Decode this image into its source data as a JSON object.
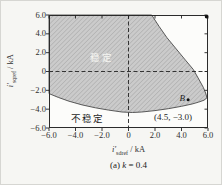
{
  "figure": {
    "caption": {
      "prefix": "(a) ",
      "var": "k",
      "rest": " = 0.4"
    }
  },
  "chart_data": {
    "type": "area",
    "xlabel": {
      "var": "i′",
      "sub": "sdref",
      "unit": " / kA"
    },
    "ylabel": {
      "var": "i′",
      "sub": "sqref",
      "unit": " / kA"
    },
    "xlim": [
      -6,
      6
    ],
    "ylim": [
      -6,
      6
    ],
    "grid": false,
    "x_tick_values": [
      -6,
      -4,
      -2,
      0,
      2,
      4,
      6
    ],
    "x_tick_labels": [
      "−6.0",
      "−4.0",
      "−2.0",
      "0",
      "2.0",
      "4.0",
      "6.0"
    ],
    "y_tick_values": [
      6,
      4,
      2,
      0,
      -2,
      -4,
      -6
    ],
    "y_tick_labels": [
      "6.0",
      "4.0",
      "2.0",
      "0",
      "−2.0",
      "−4.0",
      "−6.0"
    ],
    "reference_lines": {
      "horizontal_y": 0,
      "vertical_x": 0
    },
    "frame_color": "#2b2b2b",
    "plot_bg": "#fcfcfa",
    "stable_region": {
      "label": "稳定",
      "fill": "#cbcbcb",
      "hatch_color": "#a8a8a8",
      "edge_color": "#4a4a4a",
      "boundary": [
        [
          -6,
          6
        ],
        [
          1.75,
          6
        ],
        [
          2.3,
          4.8
        ],
        [
          2.9,
          3.6
        ],
        [
          3.6,
          2.4
        ],
        [
          4.3,
          1.2
        ],
        [
          4.9,
          0.2
        ],
        [
          5.3,
          -0.8
        ],
        [
          5.65,
          -1.7
        ],
        [
          5.85,
          -2.4
        ],
        [
          5.92,
          -2.8
        ],
        [
          5.7,
          -3.05
        ],
        [
          5.3,
          -3.25
        ],
        [
          4.8,
          -3.45
        ],
        [
          4.0,
          -3.7
        ],
        [
          3.0,
          -3.95
        ],
        [
          2.0,
          -4.15
        ],
        [
          1.0,
          -4.3
        ],
        [
          0.3,
          -4.35
        ],
        [
          -0.5,
          -4.3
        ],
        [
          -1.5,
          -4.1
        ],
        [
          -2.5,
          -3.85
        ],
        [
          -3.5,
          -3.55
        ],
        [
          -4.5,
          -3.15
        ],
        [
          -5.3,
          -2.75
        ],
        [
          -6,
          -2.35
        ]
      ]
    },
    "unstable_label": "不稳定",
    "point_B": {
      "name": "B",
      "x": 4.5,
      "y": -3.0,
      "annotation": "(4.5, −3.0)"
    },
    "corner_marker": {
      "x": 6,
      "y": 6
    }
  }
}
